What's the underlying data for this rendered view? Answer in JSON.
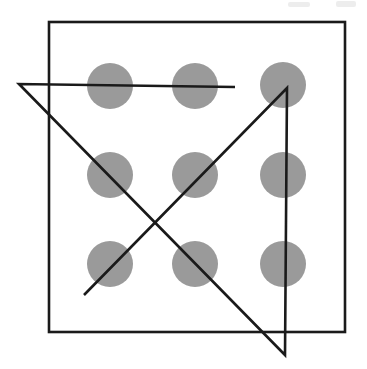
{
  "figure": {
    "caption": "",
    "width": 367,
    "height": 369,
    "background_color": "#ffffff",
    "stroke_color": "#1a1a1a",
    "dot_color": "#9a9a9a",
    "stroke_width": 2.6
  },
  "frame": {
    "name": "square-border",
    "x": 49,
    "y": 22,
    "width": 296,
    "height": 310,
    "stroke_color": "#1a1a1a",
    "stroke_width": 2.6,
    "fill": "none"
  },
  "dots": {
    "radius": 23,
    "fill": "#9a9a9a",
    "rows": 3,
    "columns": 3,
    "items": [
      {
        "label": "dot-row1-col1",
        "cx": 110,
        "cy": 86
      },
      {
        "label": "dot-row1-col2",
        "cx": 195,
        "cy": 86
      },
      {
        "label": "dot-row1-col3",
        "cx": 283,
        "cy": 85
      },
      {
        "label": "dot-row2-col1",
        "cx": 110,
        "cy": 175
      },
      {
        "label": "dot-row2-col2",
        "cx": 195,
        "cy": 175
      },
      {
        "label": "dot-row2-col3",
        "cx": 283,
        "cy": 175
      },
      {
        "label": "dot-row3-col1",
        "cx": 110,
        "cy": 264
      },
      {
        "label": "dot-row3-col2",
        "cx": 195,
        "cy": 264
      },
      {
        "label": "dot-row3-col3",
        "cx": 283,
        "cy": 264
      }
    ]
  },
  "solution_path": {
    "name": "four-line-solution",
    "segment_count": 4,
    "points": "235,87 19,84 285,355 287,88 84,295",
    "segments": [
      {
        "label": "segment-1-horizontal-top",
        "x1": 235,
        "y1": 87,
        "x2": 19,
        "y2": 84
      },
      {
        "label": "segment-2-diagonal-down-right",
        "x1": 19,
        "y1": 84,
        "x2": 285,
        "y2": 355
      },
      {
        "label": "segment-3-vertical-up",
        "x1": 285,
        "y1": 355,
        "x2": 287,
        "y2": 88
      },
      {
        "label": "segment-4-diagonal-down-left",
        "x1": 287,
        "y1": 88,
        "x2": 84,
        "y2": 295
      }
    ]
  },
  "artifacts": [
    {
      "label": "scan-smudge-left",
      "x": 288,
      "y": 2,
      "width": 22,
      "height": 5
    },
    {
      "label": "scan-smudge-right",
      "x": 336,
      "y": 1,
      "width": 20,
      "height": 6
    }
  ]
}
